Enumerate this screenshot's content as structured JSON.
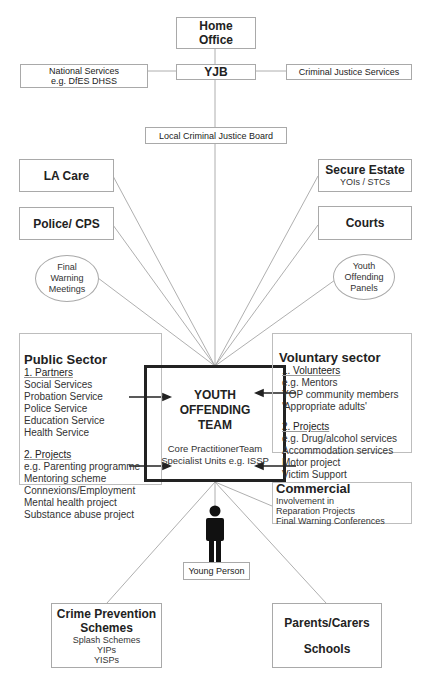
{
  "top": {
    "home_office": "Home Office",
    "home_office_lines": [
      "Home",
      "Office"
    ],
    "yjb": "YJB",
    "national_services": [
      "National Services",
      "e.g. DfES DHSS"
    ],
    "criminal_justice_services": "Criminal Justice Services",
    "local_cjb": "Local Criminal Justice Board"
  },
  "left": {
    "la_care": "LA Care",
    "police_cps": "Police/ CPS",
    "final_warning": [
      "Final",
      "Warning",
      "Meetings"
    ]
  },
  "right": {
    "secure_estate_title": "Secure Estate",
    "secure_estate_sub": "YOIs / STCs",
    "courts": "Courts",
    "yop": [
      "Youth",
      "Offending",
      "Panels"
    ]
  },
  "public_sector": {
    "title": "Public Sector",
    "partners_heading": "1. Partners",
    "partners": [
      "Social Services",
      "Probation Service",
      "Police Service",
      "Education Service",
      "Health Service"
    ],
    "projects_heading": "2. Projects",
    "projects": [
      "e.g. Parenting programme",
      "Mentoring scheme",
      "Connexions/Employment",
      "Mental health project",
      "Substance abuse project"
    ]
  },
  "yot": {
    "title": [
      "YOUTH",
      "OFFENDING",
      "TEAM"
    ],
    "sub": [
      "Core PractitionerTeam",
      "Specialist Units e.g. ISSP"
    ]
  },
  "voluntary_sector": {
    "title": "Voluntary sector",
    "volunteers_heading": "1. Volunteers",
    "volunteers": [
      "e.g. Mentors",
      "YOP community members",
      "'Appropriate adults'"
    ],
    "projects_heading": "2. Projects",
    "projects": [
      "e.g. Drug/alcohol services",
      "Accommodation services",
      "Motor project",
      "Victim Support"
    ]
  },
  "commercial": {
    "title": "Commercial",
    "items": [
      "Involvement in",
      "Reparation Projects",
      "Final Warning Conferences"
    ]
  },
  "young_person": {
    "label": "Young Person",
    "icon": "person-icon"
  },
  "bottom": {
    "crime_prevention_title": [
      "Crime Prevention",
      "Schemes"
    ],
    "crime_prevention_items": [
      "Splash Schemes",
      "YIPs",
      "YISPs"
    ],
    "parents_carers": "Parents/Carers",
    "schools": "Schools"
  },
  "colors": {
    "line": "#9a9a9a",
    "box_border": "#a9a9a9",
    "yot_border": "#222222",
    "text": "#222222"
  }
}
